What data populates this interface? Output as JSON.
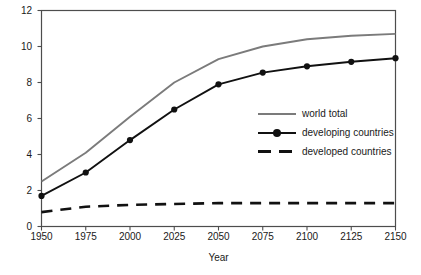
{
  "chart_data": {
    "type": "line",
    "title": "",
    "xlabel": "Year",
    "ylabel": "Billions",
    "x": [
      1950,
      1975,
      2000,
      2025,
      2050,
      2075,
      2100,
      2125,
      2150
    ],
    "xlim": [
      1950,
      2150
    ],
    "ylim": [
      0,
      12
    ],
    "xticks": [
      "1950",
      "1975",
      "2000",
      "2025",
      "2050",
      "2075",
      "2100",
      "2125",
      "2150"
    ],
    "yticks": [
      "0",
      "2",
      "4",
      "6",
      "8",
      "10",
      "12"
    ],
    "grid": false,
    "legend_position": "center-right-inside",
    "series": [
      {
        "name": "world total",
        "color": "#7b7b7b",
        "style": "solid",
        "markers": false,
        "values": [
          2.5,
          4.1,
          6.1,
          8.0,
          9.3,
          10.0,
          10.4,
          10.6,
          10.7
        ]
      },
      {
        "name": "developing countries",
        "color": "#111111",
        "style": "solid",
        "markers": true,
        "values": [
          1.7,
          3.0,
          4.8,
          6.5,
          7.9,
          8.55,
          8.9,
          9.15,
          9.35
        ]
      },
      {
        "name": "developed countries",
        "color": "#111111",
        "style": "dashed",
        "markers": false,
        "values": [
          0.8,
          1.1,
          1.2,
          1.25,
          1.3,
          1.3,
          1.3,
          1.3,
          1.3
        ]
      }
    ]
  },
  "axes": {
    "y_title": "Billions",
    "x_title": "Year"
  },
  "legend": {
    "items": [
      {
        "label": "world total"
      },
      {
        "label": "developing countries"
      },
      {
        "label": "developed countries"
      }
    ]
  }
}
